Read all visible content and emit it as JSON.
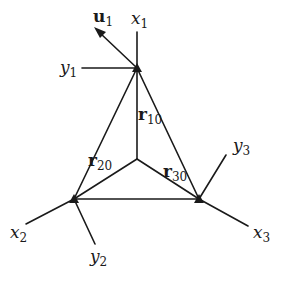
{
  "diagram": {
    "type": "three-node triangular frame with local coordinate axes",
    "line_color": "#1a1a1a",
    "nodes": [
      {
        "id": "1",
        "x": 137,
        "y": 68
      },
      {
        "id": "2",
        "x": 74,
        "y": 199
      },
      {
        "id": "3",
        "x": 199,
        "y": 199
      },
      {
        "id": "0",
        "x": 137,
        "y": 159
      }
    ],
    "labels": {
      "u1": {
        "base": "u",
        "sub": "1"
      },
      "x1": {
        "base": "x",
        "sub": "1"
      },
      "y1": {
        "base": "y",
        "sub": "1"
      },
      "x2": {
        "base": "x",
        "sub": "2"
      },
      "y2": {
        "base": "y",
        "sub": "2"
      },
      "x3": {
        "base": "x",
        "sub": "3"
      },
      "y3": {
        "base": "y",
        "sub": "3"
      },
      "r10": {
        "base": "r",
        "sub": "10"
      },
      "r20": {
        "base": "r",
        "sub": "20"
      },
      "r30": {
        "base": "r",
        "sub": "30"
      }
    }
  }
}
